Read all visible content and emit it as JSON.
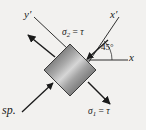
{
  "figure": {
    "background_color": "#f2f1ef",
    "ink_color": "#1a1a1a",
    "caption": "sp.",
    "axes": {
      "x_label": "x",
      "x_prime_label": "y′",
      "y_prime_label": "x′"
    },
    "labels": {
      "y_prime": "y′",
      "x_prime": "x′",
      "x": "x",
      "angle": "45°",
      "sigma2_name": "σ",
      "sigma2_sub": "2",
      "sigma2_eq": "=",
      "sigma2_value": "τ",
      "sigma1_name": "σ",
      "sigma1_sub": "1",
      "sigma1_eq": "=",
      "sigma1_value": "τ"
    },
    "element": {
      "shape": "rotated-square",
      "rotation_deg": 45,
      "fill_style": "metallic-gradient",
      "fill_dark": "#4a4a4a",
      "fill_light": "#d8d8d8",
      "stroke": "#2b2b2b"
    },
    "stresses": [
      {
        "name": "sigma-2-compression-upper-right",
        "label": "σ₂ = τ",
        "direction": "inward",
        "sense": "compression",
        "axis": "x-prime"
      },
      {
        "name": "sigma-2-compression-lower-left",
        "label": "σ₂ = τ",
        "direction": "inward",
        "sense": "compression",
        "axis": "x-prime"
      },
      {
        "name": "sigma-1-tension-upper-left",
        "label": "σ₁ = τ",
        "direction": "outward",
        "sense": "tension",
        "axis": "y-prime"
      },
      {
        "name": "sigma-1-tension-lower-right",
        "label": "σ₁ = τ",
        "direction": "outward",
        "sense": "tension",
        "axis": "y-prime"
      }
    ]
  }
}
